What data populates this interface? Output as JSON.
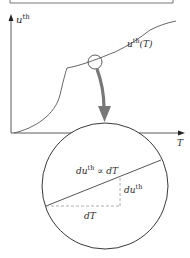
{
  "figure": {
    "y_axis_label": {
      "base": "u",
      "sup": "th"
    },
    "x_axis_label": "T",
    "curve_label": {
      "base": "u",
      "sup": "th",
      "suffix": "(T)"
    },
    "zoom_labels": {
      "relation": {
        "lhs_base": "du",
        "lhs_sup": "th",
        "operator": "∝",
        "rhs": "dT"
      },
      "rise": {
        "base": "du",
        "sup": "th"
      },
      "run": "dT"
    },
    "colors": {
      "line": "#555555",
      "axis": "#333333",
      "arrow": "#777777",
      "dashed": "#999999",
      "circle": "#222222"
    }
  }
}
